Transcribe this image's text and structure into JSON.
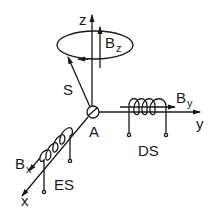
{
  "diagram": {
    "type": "physics-schematic",
    "colors": {
      "stroke": "#1a1a1a",
      "background": "#ffffff"
    },
    "labels": {
      "z_axis": "z",
      "y_axis": "y",
      "x_axis": "x",
      "origin": "A",
      "spin": "S",
      "bz_main": "B",
      "bz_sub": "z",
      "by_main": "B",
      "by_sub": "y",
      "bx_main": "B",
      "bx_sub": "x",
      "coil_y": "DS",
      "coil_x": "ES"
    }
  }
}
